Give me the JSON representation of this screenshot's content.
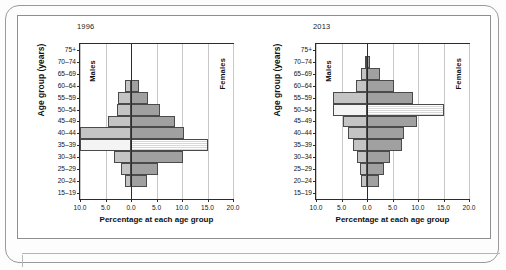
{
  "figure": {
    "xlabel": "Percentage at each age group",
    "ylabel": "Age group (years)",
    "males_label": "Males",
    "females_label": "Females"
  },
  "axis": {
    "xticks": [
      "10.0",
      "5.0",
      "0.0",
      "5.0",
      "10.0",
      "15.0",
      "20.0"
    ],
    "xtick_values": [
      -10,
      -5,
      0,
      5,
      10,
      15,
      20
    ],
    "xmin": -10,
    "xmax": 20,
    "age_groups": [
      "75+",
      "70–74",
      "65–69",
      "60–64",
      "55–59",
      "50–54",
      "45–49",
      "40–44",
      "35–39",
      "30–34",
      "25–29",
      "20–24",
      "15–19"
    ]
  },
  "colors": {
    "males_fill": "#c4c4c4",
    "females_fill": "#a0a0a0",
    "highlight_fill": "#f4f4f4",
    "outline": "#4a4a4a",
    "axis": "#2b2b2b",
    "grid": "#c9c9c9"
  },
  "chart_data": [
    {
      "type": "bar",
      "title": "1996",
      "subtitle": "",
      "xlabel": "Percentage at each age group",
      "ylabel": "Age group (years)",
      "orientation": "population-pyramid",
      "categories": [
        "75+",
        "70–74",
        "65–69",
        "60–64",
        "55–59",
        "50–54",
        "45–49",
        "40–44",
        "35–39",
        "30–34",
        "25–29",
        "20–24",
        "15–19"
      ],
      "xlim": [
        -10,
        20
      ],
      "grid": true,
      "legend": [
        "Males",
        "Females"
      ],
      "legend_position": "inside-left-and-right",
      "highlight_category": "35–39",
      "series": [
        {
          "name": "Males",
          "values": [
            0.0,
            0.0,
            0.0,
            1.2,
            2.6,
            2.8,
            4.6,
            10.0,
            10.0,
            3.3,
            1.9,
            1.2,
            0.0
          ]
        },
        {
          "name": "Females",
          "values": [
            0.0,
            0.0,
            0.0,
            1.6,
            3.4,
            5.6,
            8.6,
            10.4,
            15.0,
            10.2,
            5.2,
            3.2,
            0.0
          ]
        }
      ]
    },
    {
      "type": "bar",
      "title": "2013",
      "subtitle": "",
      "xlabel": "Percentage at each age group",
      "ylabel": "Age group (years)",
      "orientation": "population-pyramid",
      "categories": [
        "75+",
        "70–74",
        "65–69",
        "60–64",
        "55–59",
        "50–54",
        "45–49",
        "40–44",
        "35–39",
        "30–34",
        "25–29",
        "20–24",
        "15–19"
      ],
      "xlim": [
        -10,
        20
      ],
      "grid": true,
      "legend": [
        "Males",
        "Females"
      ],
      "legend_position": "inside-left-and-right",
      "highlight_category": "50–54",
      "series": [
        {
          "name": "Males",
          "values": [
            0.0,
            0.3,
            1.2,
            2.2,
            6.6,
            6.6,
            4.8,
            3.8,
            2.8,
            2.0,
            1.4,
            1.2,
            0.0
          ]
        },
        {
          "name": "Females",
          "values": [
            0.0,
            0.6,
            2.6,
            5.2,
            9.0,
            15.0,
            9.8,
            7.2,
            6.8,
            4.6,
            3.3,
            2.4,
            0.0
          ]
        }
      ]
    }
  ]
}
